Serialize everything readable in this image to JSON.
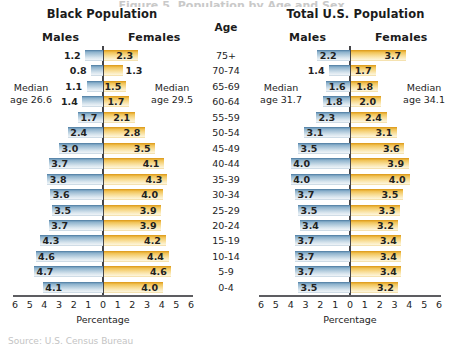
{
  "bleed": {
    "top_text": "Figure 5. Population by Age and Sex",
    "bottom_text": "Source: U.S. Census Bureau"
  },
  "age_column": {
    "header": "Age",
    "labels": [
      "75+",
      "70-74",
      "65-69",
      "60-64",
      "55-59",
      "50-54",
      "45-49",
      "40-44",
      "35-39",
      "30-34",
      "25-29",
      "20-24",
      "15-19",
      "10-14",
      "5-9",
      "0-4"
    ]
  },
  "axis": {
    "ticks": [
      "6",
      "5",
      "4",
      "3",
      "2",
      "1",
      "0",
      "1",
      "2",
      "3",
      "4",
      "5",
      "6"
    ],
    "caption": "Percentage",
    "max": 6
  },
  "colors": {
    "male_bar": "#a9c6da",
    "female_bar": "#f5d07e",
    "zero_line": "#46464a",
    "axis_line": "#5d5d61",
    "text": "#1d1d1d"
  },
  "panels": [
    {
      "id": "black",
      "title": "Black Population",
      "males_label": "Males",
      "females_label": "Females",
      "median_male": "Median\nage 26.6",
      "median_male_line1": "Median",
      "median_male_line2": "age 26.6",
      "median_female_line1": "Median",
      "median_female_line2": "age 29.5",
      "male_values": [
        1.2,
        0.8,
        1.1,
        1.4,
        1.7,
        2.4,
        3.0,
        3.7,
        3.8,
        3.6,
        3.5,
        3.7,
        4.3,
        4.6,
        4.7,
        4.1
      ],
      "female_values": [
        2.3,
        1.3,
        1.5,
        1.7,
        2.1,
        2.8,
        3.5,
        4.1,
        4.3,
        4.0,
        3.9,
        3.9,
        4.2,
        4.4,
        4.6,
        4.0
      ]
    },
    {
      "id": "total",
      "title": "Total U.S. Population",
      "males_label": "Males",
      "females_label": "Females",
      "median_male_line1": "Median",
      "median_male_line2": "age 31.7",
      "median_female_line1": "Median",
      "median_female_line2": "age 34.1",
      "male_values": [
        2.2,
        1.4,
        1.6,
        1.8,
        2.3,
        3.1,
        3.5,
        4.0,
        4.0,
        3.7,
        3.5,
        3.4,
        3.7,
        3.7,
        3.7,
        3.5
      ],
      "female_values": [
        3.7,
        1.7,
        1.8,
        2.0,
        2.4,
        3.1,
        3.6,
        3.9,
        4.0,
        3.5,
        3.3,
        3.2,
        3.4,
        3.4,
        3.4,
        3.2
      ]
    }
  ],
  "chart_data": {
    "type": "bar",
    "subtype": "population-pyramid",
    "xlabel": "Percentage",
    "ylabel": "Age",
    "xlim": [
      -6,
      6
    ],
    "xticks": [
      6,
      5,
      4,
      3,
      2,
      1,
      0,
      1,
      2,
      3,
      4,
      5,
      6
    ],
    "grid": false,
    "legend": "none",
    "categories": [
      "75+",
      "70-74",
      "65-69",
      "60-64",
      "55-59",
      "50-54",
      "45-49",
      "40-44",
      "35-39",
      "30-34",
      "25-29",
      "20-24",
      "15-19",
      "10-14",
      "5-9",
      "0-4"
    ],
    "panels": [
      {
        "name": "Black Population",
        "median_age_males": 26.6,
        "median_age_females": 29.5,
        "series": [
          {
            "name": "Males",
            "direction": "left",
            "color": "#a9c6da",
            "values": [
              1.2,
              0.8,
              1.1,
              1.4,
              1.7,
              2.4,
              3.0,
              3.7,
              3.8,
              3.6,
              3.5,
              3.7,
              4.3,
              4.6,
              4.7,
              4.1
            ]
          },
          {
            "name": "Females",
            "direction": "right",
            "color": "#f5d07e",
            "values": [
              2.3,
              1.3,
              1.5,
              1.7,
              2.1,
              2.8,
              3.5,
              4.1,
              4.3,
              4.0,
              3.9,
              3.9,
              4.2,
              4.4,
              4.6,
              4.0
            ]
          }
        ]
      },
      {
        "name": "Total U.S. Population",
        "median_age_males": 31.7,
        "median_age_females": 34.1,
        "series": [
          {
            "name": "Males",
            "direction": "left",
            "color": "#a9c6da",
            "values": [
              2.2,
              1.4,
              1.6,
              1.8,
              2.3,
              3.1,
              3.5,
              4.0,
              4.0,
              3.7,
              3.5,
              3.4,
              3.7,
              3.7,
              3.7,
              3.5
            ]
          },
          {
            "name": "Females",
            "direction": "right",
            "color": "#f5d07e",
            "values": [
              3.7,
              1.7,
              1.8,
              2.0,
              2.4,
              3.1,
              3.6,
              3.9,
              4.0,
              3.5,
              3.3,
              3.2,
              3.4,
              3.4,
              3.4,
              3.2
            ]
          }
        ]
      }
    ]
  }
}
